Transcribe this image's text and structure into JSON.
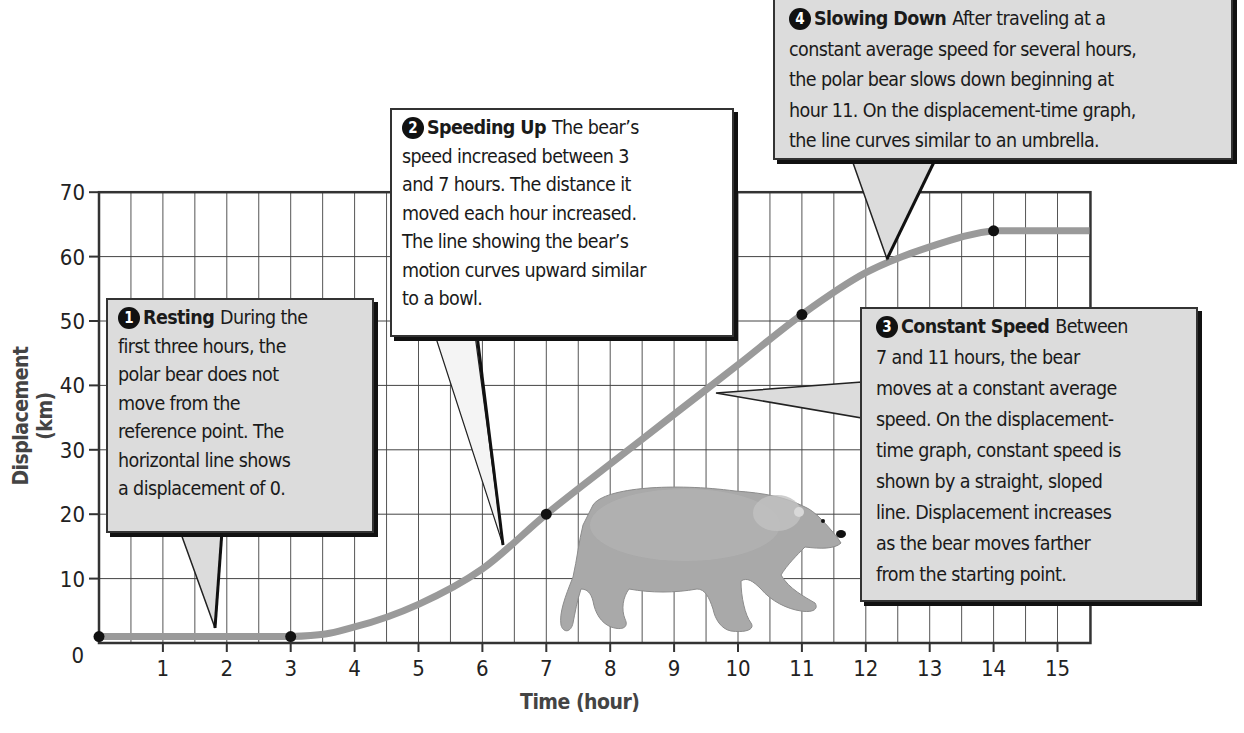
{
  "chart_data": {
    "type": "line",
    "title": "",
    "xlabel": "Time (hour)",
    "ylabel": "Displacement (km)",
    "xlim": [
      0,
      15.5
    ],
    "ylim": [
      0,
      70
    ],
    "grid": true,
    "x_ticks": [
      1,
      2,
      3,
      4,
      5,
      6,
      7,
      8,
      9,
      10,
      11,
      12,
      13,
      14,
      15
    ],
    "y_ticks": [
      0,
      10,
      20,
      30,
      40,
      50,
      60,
      70
    ],
    "series": [
      {
        "name": "Polar bear displacement",
        "x": [
          0,
          3,
          4,
          5,
          6,
          7,
          8,
          9,
          10,
          11,
          12,
          13,
          14,
          15.5
        ],
        "values": [
          1,
          1,
          2.5,
          6,
          11.5,
          20,
          27.8,
          35.5,
          43.2,
          51,
          57.5,
          61.5,
          64,
          64
        ],
        "color": "#9a9a9a"
      }
    ],
    "marked_points": [
      {
        "x": 0,
        "y": 1
      },
      {
        "x": 3,
        "y": 1
      },
      {
        "x": 7,
        "y": 20
      },
      {
        "x": 11,
        "y": 51
      },
      {
        "x": 14,
        "y": 64
      }
    ],
    "annotations": [
      {
        "number": "1",
        "title": "Resting",
        "text": "During the first three hours, the polar bear does not move from the reference point. The horizontal line shows a displacement of 0.",
        "lines": [
          "During the",
          "first three hours, the",
          "polar bear does not",
          "move from the",
          "reference point. The",
          "horizontal line shows",
          "a displacement of 0."
        ]
      },
      {
        "number": "2",
        "title": "Speeding Up",
        "text": "The bear's speed increased between 3 and 7 hours. The distance it moved each hour increased. The line showing the bear's motion curves upward similar to a bowl.",
        "lines": [
          "The bear’s",
          "speed increased between 3",
          "and 7 hours. The distance it",
          "moved each hour increased.",
          "The line showing the bear’s",
          "motion curves upward similar",
          "to a bowl."
        ]
      },
      {
        "number": "3",
        "title": "Constant Speed",
        "text": "Between 7 and 11 hours, the bear moves at a constant average speed. On the displacement-time graph, constant speed is shown by a straight, sloped line. Displacement increases as the bear moves farther from the starting point.",
        "lines": [
          "Between",
          "7 and 11 hours, the bear",
          "moves at a constant average",
          "speed. On the displacement-",
          "time graph, constant speed is",
          "shown by a straight, sloped",
          "line. Displacement increases",
          "as the bear moves farther",
          "from the starting point."
        ]
      },
      {
        "number": "4",
        "title": "Slowing Down",
        "text": "After traveling at a constant average speed for several hours, the polar bear slows down beginning at hour 11. On the displacement-time graph, the line curves similar to an umbrella.",
        "lines": [
          "After traveling at a",
          "constant average speed for several hours,",
          "the polar bear slows down beginning at",
          "hour 11. On the displacement-time graph,",
          "the line curves similar to an umbrella."
        ]
      }
    ],
    "illustration": "polar-bear"
  }
}
